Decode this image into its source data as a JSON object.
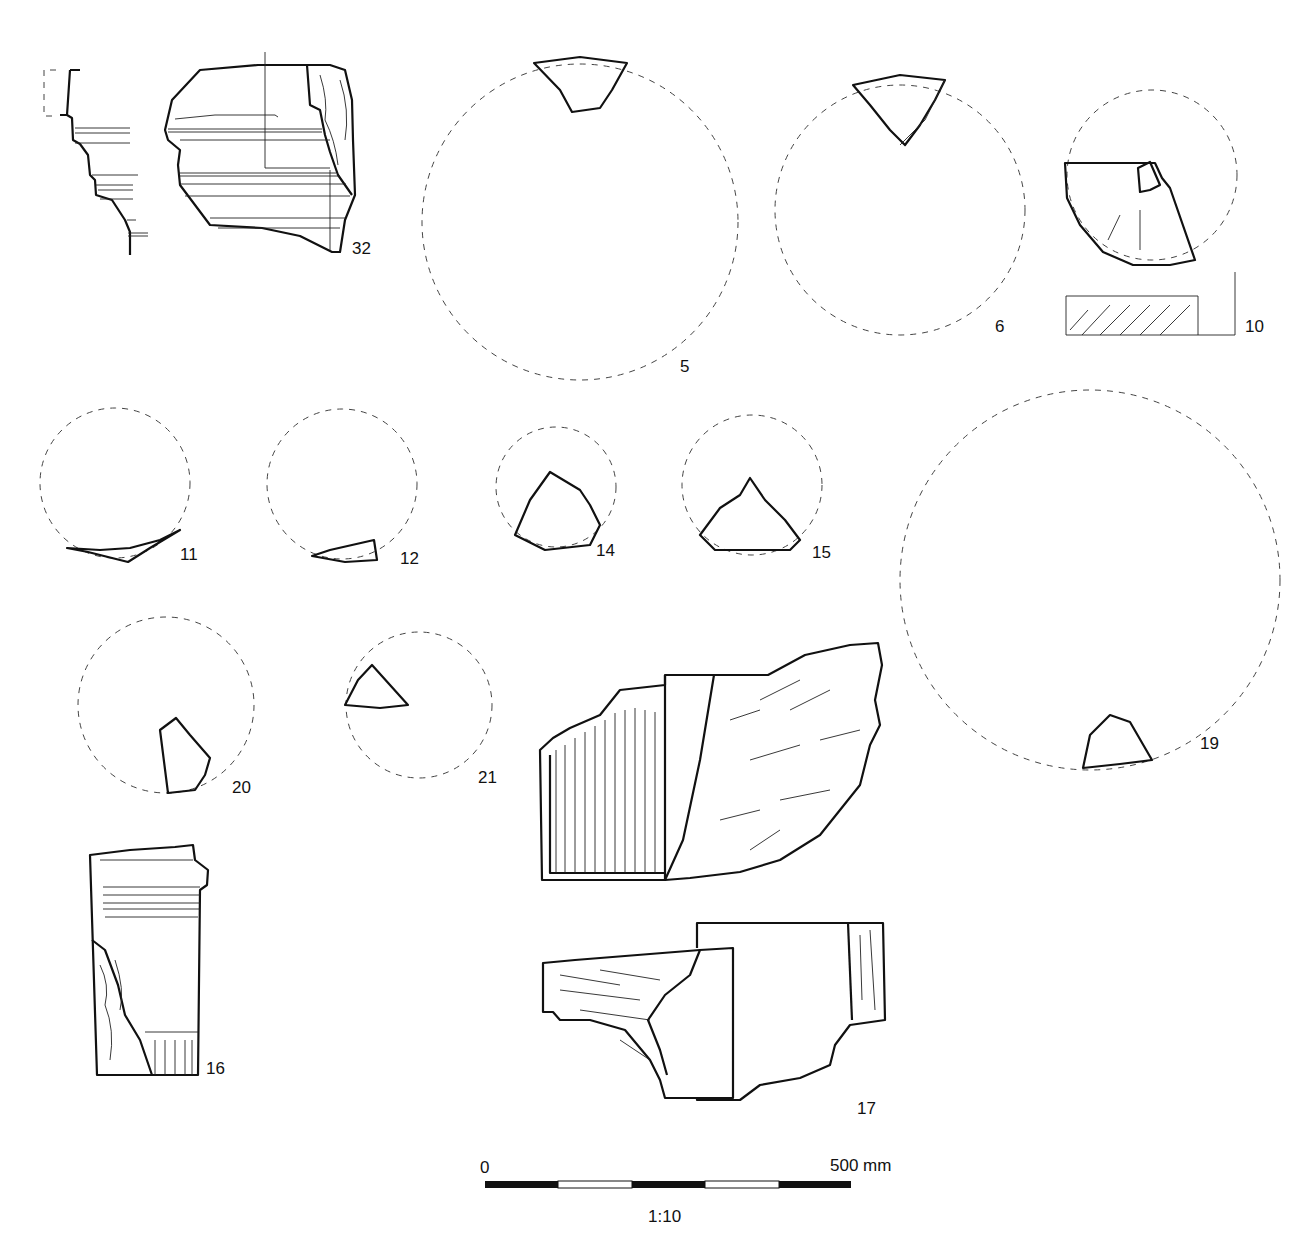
{
  "plate": {
    "title": "Catalogue plate of fragments",
    "scale_bar": {
      "start_label": "0",
      "end_label": "500 mm",
      "ratio_label": "1:10",
      "segments": 5
    },
    "fragments": [
      {
        "id": "32",
        "label": "32"
      },
      {
        "id": "5",
        "label": "5"
      },
      {
        "id": "6",
        "label": "6"
      },
      {
        "id": "10",
        "label": "10"
      },
      {
        "id": "11",
        "label": "11"
      },
      {
        "id": "12",
        "label": "12"
      },
      {
        "id": "14",
        "label": "14"
      },
      {
        "id": "15",
        "label": "15"
      },
      {
        "id": "19",
        "label": "19"
      },
      {
        "id": "20",
        "label": "20"
      },
      {
        "id": "21",
        "label": "21"
      },
      {
        "id": "16",
        "label": "16"
      },
      {
        "id": "17",
        "label": "17"
      }
    ]
  }
}
